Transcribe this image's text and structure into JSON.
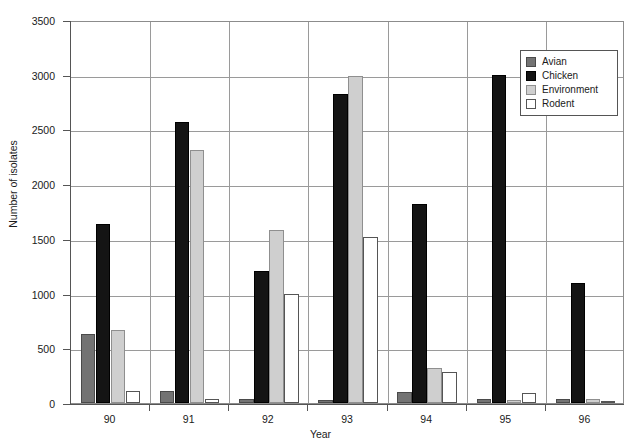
{
  "chart_data": {
    "type": "bar",
    "title": "",
    "xlabel": "Year",
    "ylabel": "Number of isolates",
    "categories": [
      "90",
      "91",
      "92",
      "93",
      "94",
      "95",
      "96"
    ],
    "ylim": [
      0,
      3500
    ],
    "yticks": [
      0,
      500,
      1000,
      1500,
      2000,
      2500,
      3000,
      3500
    ],
    "grid": true,
    "legend_position": "top-right",
    "series": [
      {
        "name": "Avian",
        "color": "#737373",
        "values": [
          630,
          110,
          40,
          30,
          100,
          40,
          40
        ]
      },
      {
        "name": "Chicken",
        "color": "#141414",
        "values": [
          1640,
          2570,
          1210,
          2820,
          1820,
          3000,
          1100
        ]
      },
      {
        "name": "Environment",
        "color": "#cfcfcf",
        "values": [
          670,
          2310,
          1580,
          2990,
          320,
          30,
          40
        ]
      },
      {
        "name": "Rodent",
        "color": "#ffffff",
        "values": [
          110,
          40,
          1000,
          1520,
          280,
          90,
          10
        ]
      }
    ]
  },
  "axes": {
    "y_title": "Number of isolates",
    "x_title": "Year",
    "y_tick_labels": [
      "0",
      "500",
      "1000",
      "1500",
      "2000",
      "2500",
      "3000",
      "3500"
    ],
    "x_tick_labels": [
      "90",
      "91",
      "92",
      "93",
      "94",
      "95",
      "96"
    ]
  },
  "legend": {
    "items": [
      {
        "label": "Avian"
      },
      {
        "label": "Chicken"
      },
      {
        "label": "Environment"
      },
      {
        "label": "Rodent"
      }
    ]
  },
  "caption": {
    "text": ""
  }
}
